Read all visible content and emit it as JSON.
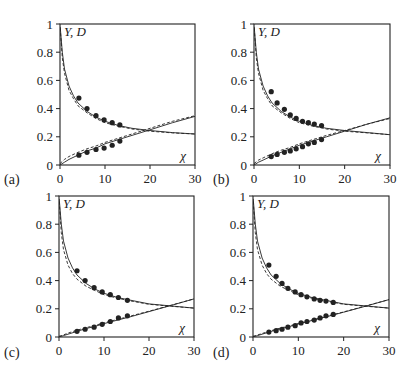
{
  "chart_data": [
    {
      "type": "line",
      "panel": "(a)",
      "ylabel": "Y, D",
      "xlabel": "χ",
      "xlim": [
        0,
        30
      ],
      "ylim": [
        0,
        1
      ],
      "xticks": [
        0,
        10,
        20,
        30
      ],
      "yticks": [
        0,
        0.2,
        0.4,
        0.6,
        0.8,
        1
      ],
      "ytick_labels": [
        "0",
        "0.2",
        "0.4",
        "0.6",
        "0.8",
        "1"
      ],
      "grid": false,
      "series": [
        {
          "name": "Y points",
          "kind": "scatter",
          "x": [
            4.2,
            6.0,
            8.0,
            9.8,
            11.6,
            13.3
          ],
          "y": [
            0.475,
            0.4,
            0.35,
            0.32,
            0.3,
            0.284
          ]
        },
        {
          "name": "D points",
          "kind": "scatter",
          "x": [
            4.2,
            6.0,
            8.0,
            9.8,
            11.6,
            13.3
          ],
          "y": [
            0.07,
            0.09,
            0.11,
            0.12,
            0.14,
            0.17
          ]
        },
        {
          "name": "Y model (solid)",
          "kind": "line",
          "x": [
            0.05,
            0.5,
            1,
            2,
            3,
            4,
            6,
            8,
            10,
            13,
            16,
            20,
            25,
            30
          ],
          "y": [
            0.98,
            0.8,
            0.68,
            0.56,
            0.49,
            0.44,
            0.38,
            0.34,
            0.31,
            0.28,
            0.26,
            0.245,
            0.23,
            0.22
          ]
        },
        {
          "name": "Y model (dashed)",
          "kind": "dashed",
          "x": [
            0.05,
            0.5,
            1,
            2,
            3,
            4,
            6,
            8,
            10,
            13,
            16,
            20,
            25,
            30
          ],
          "y": [
            0.97,
            0.76,
            0.65,
            0.53,
            0.47,
            0.42,
            0.37,
            0.33,
            0.3,
            0.275,
            0.255,
            0.24,
            0.228,
            0.22
          ]
        },
        {
          "name": "D model (solid)",
          "kind": "line",
          "x": [
            0,
            1,
            2,
            4,
            6,
            8,
            10,
            13,
            16,
            20,
            25,
            30
          ],
          "y": [
            0.0,
            0.02,
            0.04,
            0.07,
            0.1,
            0.12,
            0.15,
            0.18,
            0.21,
            0.25,
            0.3,
            0.345
          ]
        },
        {
          "name": "D model (dashed)",
          "kind": "dashed",
          "x": [
            0,
            1,
            2,
            4,
            6,
            8,
            10,
            13,
            16,
            20,
            25,
            30
          ],
          "y": [
            0.01,
            0.04,
            0.06,
            0.09,
            0.115,
            0.135,
            0.16,
            0.19,
            0.22,
            0.26,
            0.31,
            0.35
          ]
        }
      ]
    },
    {
      "type": "line",
      "panel": "(b)",
      "ylabel": "Y, D",
      "xlabel": "χ",
      "xlim": [
        0,
        30
      ],
      "ylim": [
        0,
        1
      ],
      "xticks": [
        0,
        10,
        20,
        30
      ],
      "yticks": [
        0,
        0.2,
        0.4,
        0.6,
        0.8,
        1
      ],
      "ytick_labels": [
        "0",
        "0.2",
        "0.4",
        "0.6",
        "0.8",
        "1"
      ],
      "grid": false,
      "series": [
        {
          "name": "Y points",
          "kind": "scatter",
          "x": [
            3.8,
            5.1,
            6.7,
            8.0,
            9.3,
            10.7,
            12.0,
            13.3,
            14.9
          ],
          "y": [
            0.52,
            0.44,
            0.395,
            0.355,
            0.33,
            0.31,
            0.3,
            0.29,
            0.28
          ]
        },
        {
          "name": "D points",
          "kind": "scatter",
          "x": [
            3.8,
            5.1,
            6.7,
            8.0,
            9.3,
            10.7,
            12.0,
            13.3,
            14.9
          ],
          "y": [
            0.06,
            0.075,
            0.09,
            0.1,
            0.115,
            0.13,
            0.15,
            0.16,
            0.18
          ]
        },
        {
          "name": "Y model (solid)",
          "kind": "line",
          "x": [
            0.05,
            0.5,
            1,
            2,
            3,
            4,
            6,
            8,
            10,
            13,
            16,
            20,
            25,
            30
          ],
          "y": [
            0.98,
            0.8,
            0.68,
            0.56,
            0.49,
            0.44,
            0.38,
            0.34,
            0.31,
            0.28,
            0.26,
            0.245,
            0.23,
            0.215
          ]
        },
        {
          "name": "Y model (dashed)",
          "kind": "dashed",
          "x": [
            0.05,
            0.5,
            1,
            2,
            3,
            4,
            6,
            8,
            10,
            13,
            16,
            20,
            25,
            30
          ],
          "y": [
            0.97,
            0.76,
            0.65,
            0.53,
            0.47,
            0.42,
            0.37,
            0.33,
            0.3,
            0.275,
            0.255,
            0.24,
            0.228,
            0.215
          ]
        },
        {
          "name": "D model (solid)",
          "kind": "line",
          "x": [
            0,
            1,
            2,
            4,
            6,
            8,
            10,
            13,
            16,
            20,
            25,
            30
          ],
          "y": [
            0.0,
            0.02,
            0.035,
            0.065,
            0.09,
            0.115,
            0.14,
            0.17,
            0.2,
            0.24,
            0.29,
            0.335
          ]
        },
        {
          "name": "D model (dashed)",
          "kind": "dashed",
          "x": [
            0,
            1,
            2,
            4,
            6,
            8,
            10,
            13,
            16,
            20,
            25,
            30
          ],
          "y": [
            0.01,
            0.035,
            0.05,
            0.08,
            0.105,
            0.125,
            0.15,
            0.18,
            0.21,
            0.245,
            0.29,
            0.33
          ]
        }
      ]
    },
    {
      "type": "line",
      "panel": "(c)",
      "ylabel": "Y, D",
      "xlabel": "χ",
      "xlim": [
        0,
        30
      ],
      "ylim": [
        0,
        1
      ],
      "xticks": [
        0,
        10,
        20,
        30
      ],
      "yticks": [
        0,
        0.2,
        0.4,
        0.6,
        0.8,
        1
      ],
      "ytick_labels": [
        "0",
        "0.2",
        "0.4",
        "0.6",
        "0.8",
        "1"
      ],
      "grid": false,
      "series": [
        {
          "name": "Y points",
          "kind": "scatter",
          "x": [
            4.0,
            5.8,
            7.8,
            9.6,
            11.4,
            13.2,
            15.2
          ],
          "y": [
            0.47,
            0.4,
            0.35,
            0.32,
            0.3,
            0.28,
            0.26
          ]
        },
        {
          "name": "D points",
          "kind": "scatter",
          "x": [
            4.0,
            5.8,
            7.8,
            9.6,
            11.4,
            13.2,
            15.2
          ],
          "y": [
            0.04,
            0.055,
            0.07,
            0.09,
            0.11,
            0.135,
            0.15
          ]
        },
        {
          "name": "Y model (solid)",
          "kind": "line",
          "x": [
            0.05,
            0.5,
            1,
            2,
            3,
            4,
            6,
            8,
            10,
            13,
            16,
            20,
            25,
            30
          ],
          "y": [
            0.98,
            0.8,
            0.68,
            0.56,
            0.49,
            0.44,
            0.38,
            0.34,
            0.31,
            0.28,
            0.26,
            0.235,
            0.22,
            0.205
          ]
        },
        {
          "name": "Y model (dashed)",
          "kind": "dashed",
          "x": [
            0.05,
            0.5,
            1,
            2,
            3,
            4,
            6,
            8,
            10,
            13,
            16,
            20,
            25,
            30
          ],
          "y": [
            0.96,
            0.74,
            0.62,
            0.51,
            0.45,
            0.41,
            0.36,
            0.33,
            0.3,
            0.275,
            0.255,
            0.232,
            0.218,
            0.205
          ]
        },
        {
          "name": "D model (solid)",
          "kind": "line",
          "x": [
            0,
            1,
            2,
            4,
            6,
            8,
            10,
            13,
            16,
            20,
            25,
            30
          ],
          "y": [
            0.0,
            0.01,
            0.02,
            0.04,
            0.06,
            0.075,
            0.095,
            0.12,
            0.145,
            0.18,
            0.225,
            0.27
          ]
        },
        {
          "name": "D model (dashed)",
          "kind": "dashed",
          "x": [
            0,
            1,
            2,
            4,
            6,
            8,
            10,
            13,
            16,
            20,
            25,
            30
          ],
          "y": [
            0.005,
            0.015,
            0.028,
            0.048,
            0.066,
            0.082,
            0.1,
            0.125,
            0.15,
            0.183,
            0.226,
            0.27
          ]
        }
      ]
    },
    {
      "type": "line",
      "panel": "(d)",
      "ylabel": "Y, D",
      "xlabel": "χ",
      "xlim": [
        0,
        30
      ],
      "ylim": [
        0,
        1
      ],
      "xticks": [
        0,
        10,
        20,
        30
      ],
      "yticks": [
        0,
        0.2,
        0.4,
        0.6,
        0.8,
        1
      ],
      "ytick_labels": [
        "0",
        "0.2",
        "0.4",
        "0.6",
        "0.8",
        "1"
      ],
      "grid": false,
      "series": [
        {
          "name": "Y points",
          "kind": "scatter",
          "x": [
            3.5,
            5.1,
            6.4,
            7.7,
            9.3,
            10.6,
            11.9,
            13.5,
            14.8,
            16.1,
            17.7
          ],
          "y": [
            0.51,
            0.43,
            0.38,
            0.345,
            0.32,
            0.3,
            0.285,
            0.27,
            0.26,
            0.255,
            0.245
          ]
        },
        {
          "name": "D points",
          "kind": "scatter",
          "x": [
            3.5,
            5.1,
            6.4,
            7.7,
            9.3,
            10.6,
            11.9,
            13.5,
            14.8,
            16.1,
            17.7
          ],
          "y": [
            0.035,
            0.045,
            0.055,
            0.07,
            0.08,
            0.1,
            0.11,
            0.12,
            0.135,
            0.15,
            0.16
          ]
        },
        {
          "name": "Y model (solid)",
          "kind": "line",
          "x": [
            0.05,
            0.5,
            1,
            2,
            3,
            4,
            6,
            8,
            10,
            13,
            16,
            20,
            25,
            30
          ],
          "y": [
            0.98,
            0.8,
            0.68,
            0.56,
            0.49,
            0.44,
            0.38,
            0.34,
            0.31,
            0.28,
            0.26,
            0.235,
            0.22,
            0.205
          ]
        },
        {
          "name": "Y model (dashed)",
          "kind": "dashed",
          "x": [
            0.05,
            0.5,
            1,
            2,
            3,
            4,
            6,
            8,
            10,
            13,
            16,
            20,
            25,
            30
          ],
          "y": [
            0.96,
            0.74,
            0.62,
            0.51,
            0.45,
            0.41,
            0.36,
            0.33,
            0.3,
            0.275,
            0.255,
            0.232,
            0.218,
            0.205
          ]
        },
        {
          "name": "D model (solid)",
          "kind": "line",
          "x": [
            0,
            1,
            2,
            4,
            6,
            8,
            10,
            13,
            16,
            20,
            25,
            30
          ],
          "y": [
            0.0,
            0.01,
            0.02,
            0.04,
            0.058,
            0.074,
            0.092,
            0.117,
            0.142,
            0.176,
            0.22,
            0.265
          ]
        },
        {
          "name": "D model (dashed)",
          "kind": "dashed",
          "x": [
            0,
            1,
            2,
            4,
            6,
            8,
            10,
            13,
            16,
            20,
            25,
            30
          ],
          "y": [
            0.005,
            0.014,
            0.025,
            0.045,
            0.063,
            0.079,
            0.096,
            0.12,
            0.145,
            0.178,
            0.221,
            0.265
          ]
        }
      ]
    }
  ],
  "layout": {
    "panels": [
      {
        "label": "(a)",
        "x0": 60,
        "x1": 195,
        "y0": 165,
        "y1": 24,
        "label_x": 4,
        "label_y": 184
      },
      {
        "label": "(b)",
        "x0": 254,
        "x1": 390,
        "y0": 165,
        "y1": 24,
        "label_x": 213,
        "label_y": 184
      },
      {
        "label": "(c)",
        "x0": 59,
        "x1": 194,
        "y0": 337,
        "y1": 196,
        "label_x": 4,
        "label_y": 357
      },
      {
        "label": "(d)",
        "x0": 253,
        "x1": 389,
        "y0": 337,
        "y1": 196,
        "label_x": 213,
        "label_y": 357
      }
    ],
    "colors": {
      "ink": "#222222",
      "background": "#ffffff"
    }
  }
}
